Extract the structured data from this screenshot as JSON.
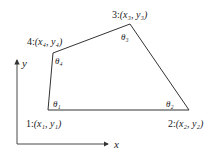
{
  "diagram": {
    "type": "quadrilateral-element",
    "colors": {
      "stroke": "#333333",
      "text": "#222222",
      "background": "#ffffff"
    },
    "axes": {
      "x_label": "x",
      "y_label": "y",
      "origin": [
        17,
        144
      ],
      "x_end": [
        110,
        144
      ],
      "y_end": [
        17,
        58
      ]
    },
    "nodes": [
      {
        "id": "1",
        "label_num": "1:",
        "label_coords": "(x₁, y₁)",
        "angle": "θ₁",
        "pos": [
          48,
          110
        ]
      },
      {
        "id": "2",
        "label_num": "2:",
        "label_coords": "(x₂, y₂)",
        "angle": "θ₂",
        "pos": [
          189,
          110
        ]
      },
      {
        "id": "3",
        "label_num": "3:",
        "label_coords": "(x₃, y₃)",
        "angle": "θ₃",
        "pos": [
          130,
          24
        ]
      },
      {
        "id": "4",
        "label_num": "4:",
        "label_coords": "(x₄, y₄)",
        "angle": "θ₄",
        "pos": [
          53,
          53
        ]
      }
    ]
  }
}
